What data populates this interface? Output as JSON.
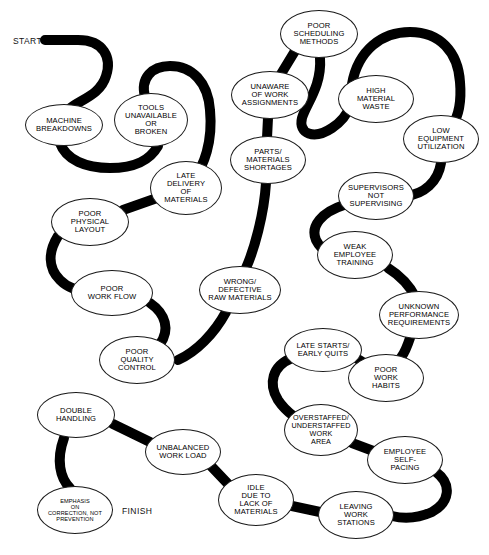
{
  "diagram": {
    "type": "flow-worm-diagram",
    "background_color": "#ffffff",
    "ribbon_color": "#000000",
    "node_fill": "#ffffff",
    "node_stroke": "#1a1a1a",
    "start_label": "START",
    "finish_label": "FINISH",
    "nodes": [
      {
        "id": "machine-breakdowns",
        "label": "MACHINE\nBREAKDOWNS",
        "cx": 64,
        "cy": 125,
        "rx": 39,
        "ry": 21,
        "font": 7.6
      },
      {
        "id": "tools-unavailable",
        "label": "TOOLS\nUNAVAILABLE\nOR\nBROKEN",
        "cx": 151,
        "cy": 120,
        "rx": 37,
        "ry": 27,
        "font": 7.6
      },
      {
        "id": "late-delivery",
        "label": "LATE\nDELIVERY\nOF\nMATERIALS",
        "cx": 186,
        "cy": 188,
        "rx": 36,
        "ry": 27,
        "font": 7.6
      },
      {
        "id": "poor-physical-layout",
        "label": "POOR\nPHYSICAL\nLAYOUT",
        "cx": 90,
        "cy": 222,
        "rx": 39,
        "ry": 24,
        "font": 7.6
      },
      {
        "id": "poor-work-flow",
        "label": "POOR\nWORK FLOW",
        "cx": 112,
        "cy": 293,
        "rx": 41,
        "ry": 23,
        "font": 7.6
      },
      {
        "id": "poor-quality-control",
        "label": "POOR\nQUALITY\nCONTROL",
        "cx": 137,
        "cy": 360,
        "rx": 38,
        "ry": 24,
        "font": 7.6
      },
      {
        "id": "double-handling",
        "label": "DOUBLE\nHANDLING",
        "cx": 76,
        "cy": 415,
        "rx": 39,
        "ry": 23,
        "font": 7.6
      },
      {
        "id": "emphasis-on-correction",
        "label": "EMPHASIS\nON\nCORRECTION, NOT\nPREVENTION",
        "cx": 75,
        "cy": 510,
        "rx": 38,
        "ry": 24,
        "font": 5.6
      },
      {
        "id": "unbalanced-work-load",
        "label": "UNBALANCED\nWORK LOAD",
        "cx": 183,
        "cy": 452,
        "rx": 38,
        "ry": 23,
        "font": 7.6
      },
      {
        "id": "idle-lack-materials",
        "label": "IDLE\nDUE TO\nLACK OF\nMATERIALS",
        "cx": 256,
        "cy": 500,
        "rx": 38,
        "ry": 26,
        "font": 7.6
      },
      {
        "id": "leaving-work-stations",
        "label": "LEAVING\nWORK\nSTATIONS",
        "cx": 356,
        "cy": 515,
        "rx": 38,
        "ry": 24,
        "font": 7.6
      },
      {
        "id": "employee-self-pacing",
        "label": "EMPLOYEE\nSELF-\nPACING",
        "cx": 405,
        "cy": 460,
        "rx": 38,
        "ry": 24,
        "font": 7.6
      },
      {
        "id": "overstaffed-understaffed",
        "label": "OVERSTAFFED/\nUNDERSTAFFED\nWORK\nAREA",
        "cx": 321,
        "cy": 430,
        "rx": 37,
        "ry": 26,
        "font": 7.2
      },
      {
        "id": "poor-work-habits",
        "label": "POOR\nWORK\nHABITS",
        "cx": 386,
        "cy": 378,
        "rx": 38,
        "ry": 24,
        "font": 7.6
      },
      {
        "id": "late-starts-early-quits",
        "label": "LATE STARTS/\nEARLY QUITS",
        "cx": 323,
        "cy": 350,
        "rx": 39,
        "ry": 22,
        "font": 7.6
      },
      {
        "id": "unknown-performance",
        "label": "UNKNOWN\nPERFORMANCE\nREQUIREMENTS",
        "cx": 419,
        "cy": 315,
        "rx": 40,
        "ry": 24,
        "font": 7.6
      },
      {
        "id": "weak-employee-training",
        "label": "WEAK\nEMPLOYEE\nTRAINING",
        "cx": 355,
        "cy": 255,
        "rx": 38,
        "ry": 24,
        "font": 7.6
      },
      {
        "id": "supervisors-not-superv",
        "label": "SUPERVISORS\nNOT\nSUPERVISING",
        "cx": 376,
        "cy": 196,
        "rx": 38,
        "ry": 24,
        "font": 7.6
      },
      {
        "id": "low-equipment-util",
        "label": "LOW\nEQUIPMENT\nUTILIZATION",
        "cx": 441,
        "cy": 139,
        "rx": 38,
        "ry": 24,
        "font": 7.6
      },
      {
        "id": "high-material-waste",
        "label": "HIGH\nMATERIAL\nWASTE",
        "cx": 376,
        "cy": 99,
        "rx": 38,
        "ry": 24,
        "font": 7.6
      },
      {
        "id": "poor-scheduling",
        "label": "POOR\nSCHEDULING\nMETHODS",
        "cx": 319,
        "cy": 34,
        "rx": 39,
        "ry": 24,
        "font": 7.6
      },
      {
        "id": "unaware-assignments",
        "label": "UNAWARE\nOF WORK\nASSIGNMENTS",
        "cx": 270,
        "cy": 95,
        "rx": 39,
        "ry": 24,
        "font": 7.6
      },
      {
        "id": "parts-materials-short",
        "label": "PARTS/\nMATERIALS\nSHORTAGES",
        "cx": 268,
        "cy": 160,
        "rx": 38,
        "ry": 24,
        "font": 7.6
      },
      {
        "id": "wrong-defective-raw",
        "label": "WRONG/\nDEFECTIVE\nRAW MATERIALS",
        "cx": 240,
        "cy": 290,
        "rx": 41,
        "ry": 24,
        "font": 7.6
      }
    ]
  }
}
